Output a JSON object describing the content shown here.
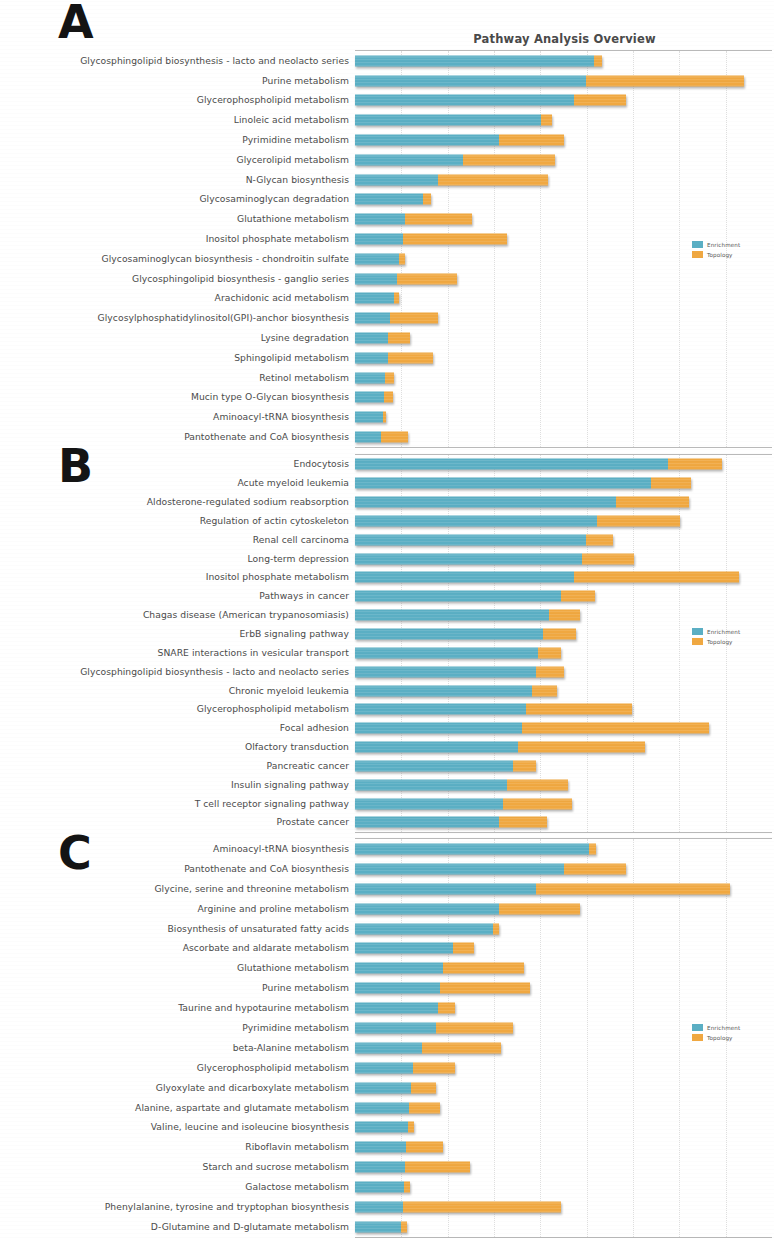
{
  "figure": {
    "title": "Pathway Analysis Overview",
    "colors": {
      "enrichment": "#5bafc4",
      "topology": "#f0a841"
    }
  },
  "legend": {
    "enrichment_label": "Enrichment",
    "topology_label": "Topology"
  },
  "panels": [
    {
      "letter": "A"
    },
    {
      "letter": "B"
    },
    {
      "letter": "C"
    }
  ],
  "chart_data": [
    {
      "type": "bar",
      "orientation": "horizontal",
      "stacked": true,
      "panel": "A",
      "title": "Pathway Analysis Overview",
      "xlabel": "",
      "ylabel": "",
      "grid": true,
      "legend_position": "right",
      "legend": [
        "Enrichment",
        "Topology"
      ],
      "xlim": [
        0,
        100
      ],
      "categories": [
        "Glycosphingolipid biosynthesis - lacto and neolacto series",
        "Purine metabolism",
        "Glycerophospholipid metabolism",
        "Linoleic acid metabolism",
        "Pyrimidine metabolism",
        "Glycerolipid metabolism",
        "N-Glycan biosynthesis",
        "Glycosaminoglycan degradation",
        "Glutathione metabolism",
        "Inositol phosphate metabolism",
        "Glycosaminoglycan biosynthesis - chondroitin sulfate",
        "Glycosphingolipid biosynthesis - ganglio series",
        "Arachidonic acid metabolism",
        "Glycosylphosphatidylinositol(GPI)-anchor biosynthesis",
        "Lysine degradation",
        "Sphingolipid metabolism",
        "Retinol metabolism",
        "Mucin type O-Glycan biosynthesis",
        "Aminoacyl-tRNA biosynthesis",
        "Pantothenate and CoA biosynthesis"
      ],
      "series": [
        {
          "name": "Enrichment",
          "values": [
            57.4,
            55.4,
            52.6,
            44.5,
            34.5,
            26.0,
            20.0,
            16.3,
            12.0,
            11.5,
            10.5,
            10.0,
            9.3,
            8.5,
            8.0,
            7.8,
            7.3,
            7.0,
            6.6,
            6.2
          ]
        },
        {
          "name": "Topology",
          "values": [
            1.9,
            38.0,
            12.3,
            2.8,
            15.5,
            22.0,
            26.3,
            1.9,
            16.0,
            25.0,
            1.5,
            14.5,
            1.3,
            11.5,
            5.2,
            11.0,
            2.0,
            2.2,
            0.8,
            6.5
          ]
        }
      ]
    },
    {
      "type": "bar",
      "orientation": "horizontal",
      "stacked": true,
      "panel": "B",
      "title": "",
      "xlabel": "",
      "ylabel": "",
      "grid": true,
      "legend_position": "right",
      "legend": [
        "Enrichment",
        "Topology"
      ],
      "xlim": [
        0,
        100
      ],
      "categories": [
        "Endocytosis",
        "Acute myeloid leukemia",
        "Aldosterone-regulated sodium reabsorption",
        "Regulation of actin cytoskeleton",
        "Renal cell carcinoma",
        "Long-term depression",
        "Inositol phosphate metabolism",
        "Pathways in cancer",
        "Chagas disease (American trypanosomiasis)",
        "ErbB signaling pathway",
        "SNARE interactions in vesicular transport",
        "Glycosphingolipid biosynthesis - lacto and neolacto series",
        "Chronic myeloid leukemia",
        "Glycerophospholipid metabolism",
        "Focal adhesion",
        "Olfactory transduction",
        "Pancreatic cancer",
        "Insulin signaling pathway",
        "T cell receptor signaling pathway",
        "Prostate cancer"
      ],
      "series": [
        {
          "name": "Enrichment",
          "values": [
            75.0,
            71.0,
            62.5,
            58.0,
            55.5,
            54.5,
            52.5,
            49.5,
            46.5,
            45.0,
            44.0,
            43.5,
            42.5,
            41.0,
            40.0,
            39.0,
            38.0,
            36.5,
            35.5,
            34.5
          ]
        },
        {
          "name": "Topology",
          "values": [
            13.0,
            9.5,
            17.5,
            20.0,
            6.3,
            12.5,
            39.5,
            8.0,
            7.5,
            8.0,
            5.5,
            6.5,
            6.0,
            25.5,
            45.0,
            30.5,
            5.5,
            14.5,
            16.5,
            11.5
          ]
        }
      ]
    },
    {
      "type": "bar",
      "orientation": "horizontal",
      "stacked": true,
      "panel": "C",
      "title": "",
      "xlabel": "",
      "ylabel": "",
      "grid": true,
      "legend_position": "right",
      "legend": [
        "Enrichment",
        "Topology"
      ],
      "xlim": [
        0,
        100
      ],
      "categories": [
        "Aminoacyl-tRNA biosynthesis",
        "Pantothenate and CoA biosynthesis",
        "Glycine, serine and threonine metabolism",
        "Arginine and proline metabolism",
        "Biosynthesis of unsaturated fatty acids",
        "Ascorbate and aldarate metabolism",
        "Glutathione metabolism",
        "Purine metabolism",
        "Taurine and hypotaurine metabolism",
        "Pyrimidine metabolism",
        "beta-Alanine metabolism",
        "Glycerophospholipid metabolism",
        "Glyoxylate and dicarboxylate metabolism",
        "Alanine, aspartate and glutamate metabolism",
        "Valine, leucine and isoleucine biosynthesis",
        "Riboflavin metabolism",
        "Starch and sucrose metabolism",
        "Galactose metabolism",
        "Phenylalanine, tyrosine and tryptophan biosynthesis",
        "D-Glutamine and D-glutamate metabolism"
      ],
      "series": [
        {
          "name": "Enrichment",
          "values": [
            56.0,
            50.0,
            43.5,
            34.5,
            33.0,
            23.5,
            21.0,
            20.5,
            20.0,
            19.5,
            16.0,
            14.0,
            13.5,
            13.0,
            12.6,
            12.2,
            12.0,
            11.7,
            11.5,
            11.0
          ]
        },
        {
          "name": "Topology",
          "values": [
            1.7,
            15.0,
            46.5,
            19.5,
            1.5,
            5.0,
            19.5,
            21.5,
            4.0,
            18.5,
            19.0,
            10.0,
            6.0,
            7.5,
            1.6,
            9.0,
            15.5,
            1.6,
            38.0,
            1.4
          ]
        }
      ]
    }
  ]
}
